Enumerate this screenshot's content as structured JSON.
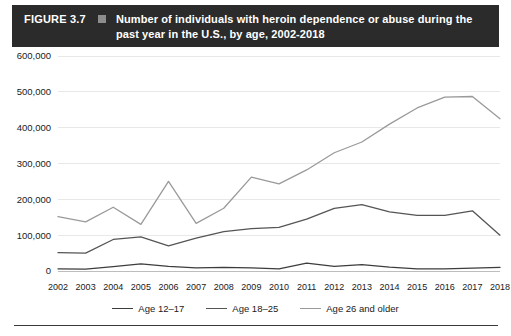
{
  "header": {
    "figure_label": "FIGURE 3.7",
    "marker_icon": "square-marker-icon",
    "title": "Number of individuals with heroin dependence or abuse during the past year in the U.S., by age, 2002-2018",
    "bar_color": "#2b2b2b",
    "text_color": "#ffffff"
  },
  "chart_data": {
    "type": "line",
    "title": "Number of individuals with heroin dependence or abuse during the past year in the U.S., by age, 2002-2018",
    "xlabel": "",
    "ylabel": "",
    "x": [
      2002,
      2003,
      2004,
      2005,
      2006,
      2007,
      2008,
      2009,
      2010,
      2011,
      2012,
      2013,
      2014,
      2015,
      2016,
      2017,
      2018
    ],
    "categories": [
      "2002",
      "2003",
      "2004",
      "2005",
      "2006",
      "2007",
      "2008",
      "2009",
      "2010",
      "2011",
      "2012",
      "2013",
      "2014",
      "2015",
      "2016",
      "2017",
      "2018"
    ],
    "ylim": [
      0,
      600000
    ],
    "ytick_values": [
      0,
      100000,
      200000,
      300000,
      400000,
      500000,
      600000
    ],
    "ytick_labels": [
      "0",
      "100,000",
      "200,000",
      "300,000",
      "400,000",
      "500,000",
      "600,000"
    ],
    "grid": true,
    "legend_position": "bottom",
    "series": [
      {
        "name": "Age 12–17",
        "color": "#3d3d3d",
        "values": [
          6000,
          5000,
          12000,
          20000,
          13000,
          9000,
          10000,
          9000,
          6000,
          22000,
          13000,
          18000,
          11000,
          6000,
          6000,
          8000,
          10000
        ]
      },
      {
        "name": "Age 18–25",
        "color": "#555555",
        "values": [
          51000,
          50000,
          88000,
          95000,
          70000,
          92000,
          110000,
          118000,
          122000,
          145000,
          175000,
          185000,
          165000,
          155000,
          155000,
          168000,
          100000
        ]
      },
      {
        "name": "Age 26 and older",
        "color": "#9a9a9a",
        "values": [
          152000,
          137000,
          178000,
          130000,
          250000,
          133000,
          175000,
          262000,
          243000,
          282000,
          330000,
          360000,
          410000,
          455000,
          485000,
          487000,
          425000
        ]
      }
    ]
  },
  "legend": [
    {
      "label": "Age 12–17",
      "color": "#3d3d3d"
    },
    {
      "label": "Age 18–25",
      "color": "#555555"
    },
    {
      "label": "Age 26 and older",
      "color": "#9a9a9a"
    }
  ]
}
